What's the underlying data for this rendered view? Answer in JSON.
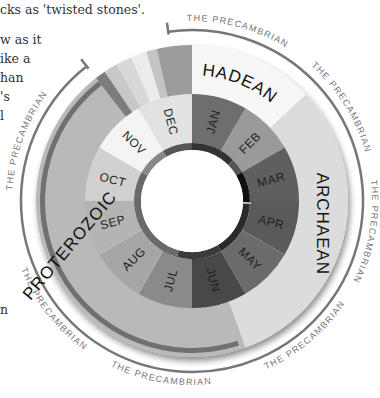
{
  "body_text": {
    "lines": [
      {
        "text": "cks as 'twisted stones'.",
        "x": 0,
        "y": 0
      },
      {
        "text": "w as it",
        "x": 0,
        "y": 30
      },
      {
        "text": "ike a",
        "x": 0,
        "y": 49
      },
      {
        "text": "han",
        "x": 0,
        "y": 68
      },
      {
        "text": "'s",
        "x": 0,
        "y": 87
      },
      {
        "text": "l",
        "x": 0,
        "y": 106
      },
      {
        "text": "n",
        "x": 0,
        "y": 300
      }
    ]
  },
  "chart_data": {
    "type": "pie",
    "subtype": "donut-clock",
    "title": "",
    "center": [
      192,
      201
    ],
    "months": [
      {
        "label": "JAN",
        "start": 0,
        "end": 30,
        "color": "#6e6e6e"
      },
      {
        "label": "FEB",
        "start": 30,
        "end": 60,
        "color": "#9a9a9a"
      },
      {
        "label": "MAR",
        "start": 60,
        "end": 90,
        "color": "#5f5f5f"
      },
      {
        "label": "APR",
        "start": 90,
        "end": 120,
        "color": "#5a5a5a"
      },
      {
        "label": "MAY",
        "start": 120,
        "end": 150,
        "color": "#6b6b6b"
      },
      {
        "label": "JUN",
        "start": 150,
        "end": 180,
        "color": "#484848"
      },
      {
        "label": "JUL",
        "start": 180,
        "end": 210,
        "color": "#8a8a8a"
      },
      {
        "label": "AUG",
        "start": 210,
        "end": 240,
        "color": "#a6a6a6"
      },
      {
        "label": "SEP",
        "start": 240,
        "end": 270,
        "color": "#b4b4b4"
      },
      {
        "label": "OCT",
        "start": 270,
        "end": 300,
        "color": "#d0d0d0"
      },
      {
        "label": "NOV",
        "start": 300,
        "end": 330,
        "color": "#f4f4f4"
      },
      {
        "label": "DEC",
        "start": 330,
        "end": 360,
        "color": "#e2e2e2"
      }
    ],
    "inner_ring": [
      {
        "start": 0,
        "end": 45,
        "color": "#333333"
      },
      {
        "start": 45,
        "end": 60,
        "color": "#555555"
      },
      {
        "start": 60,
        "end": 92,
        "color": "#111111"
      },
      {
        "start": 92,
        "end": 150,
        "color": "#2a2a2a"
      },
      {
        "start": 150,
        "end": 195,
        "color": "#3a3a3a"
      },
      {
        "start": 195,
        "end": 300,
        "color": "#6a6a6a"
      },
      {
        "start": 300,
        "end": 330,
        "color": "#888888"
      },
      {
        "start": 330,
        "end": 360,
        "color": "#555555"
      }
    ],
    "eons": [
      {
        "label": "HADEAN",
        "start": 0,
        "end": 47,
        "color": "#f7f7f7",
        "label_angle": 22
      },
      {
        "label": "ARCHAEAN",
        "start": 47,
        "end": 160,
        "color": "#dcdcdc",
        "label_angle": 100
      },
      {
        "label": "PROTEROZOIC",
        "start": 160,
        "end": 322,
        "color": "#b9b9b9",
        "label_angle": 250
      }
    ],
    "recent_strips": [
      {
        "start": 322,
        "end": 326,
        "color": "#7d7d7d"
      },
      {
        "start": 326,
        "end": 331,
        "color": "#c8c8c8"
      },
      {
        "start": 331,
        "end": 337,
        "color": "#d8d8d8"
      },
      {
        "start": 337,
        "end": 343,
        "color": "#ececec"
      },
      {
        "start": 343,
        "end": 347,
        "color": "#c4c4c4"
      },
      {
        "start": 347,
        "end": 360,
        "color": "#9c9c9c"
      }
    ],
    "proterozoic_edge_color": "#707070",
    "precambrian_arc": {
      "label": "THE PRECAMBRIAN",
      "start": 352,
      "end": 322,
      "sweep_degrees": 330,
      "color": "#777777",
      "label_angles": [
        15,
        58,
        100,
        140,
        190,
        232,
        290
      ]
    },
    "radii": {
      "hole": 51,
      "inner_ring_outer": 58,
      "month_outer": 107,
      "eon_outer": 156,
      "arc": 171,
      "arc_label": 180
    },
    "month_label_radius": 82,
    "eon_label_radius": 132
  }
}
